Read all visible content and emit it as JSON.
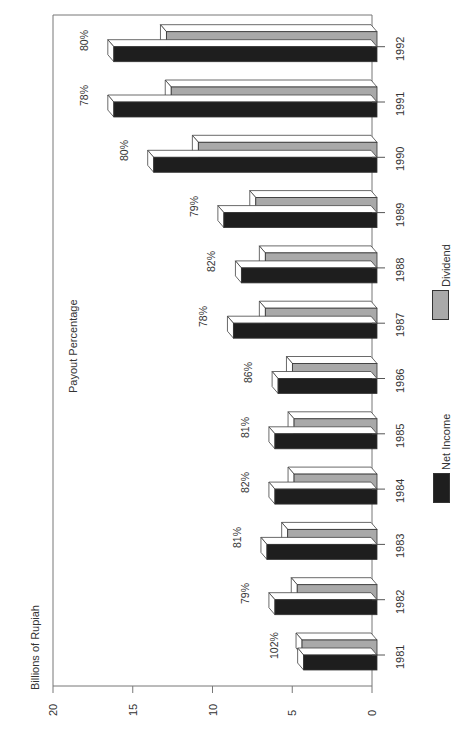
{
  "chart_data": {
    "type": "bar",
    "orientation": "rotated-90-ccw",
    "title": "",
    "ylabel": "Billions of Rupiah",
    "xlabel": "",
    "annotation_title": "Payout Percentage",
    "ylim": [
      0,
      20
    ],
    "yticks": [
      0,
      5,
      10,
      15,
      20
    ],
    "categories": [
      "1981",
      "1982",
      "1983",
      "1984",
      "1985",
      "1986",
      "1987",
      "1988",
      "1989",
      "1990",
      "1991",
      "1992"
    ],
    "series": [
      {
        "name": "Net Income",
        "color": "#1e1e1e",
        "values": [
          4.6,
          6.4,
          6.9,
          6.4,
          6.4,
          6.2,
          9.0,
          8.5,
          9.6,
          14.0,
          16.5,
          16.5
        ]
      },
      {
        "name": "Dividend",
        "color": "#a9a9a9",
        "values": [
          4.7,
          5.0,
          5.6,
          5.2,
          5.2,
          5.3,
          7.0,
          7.0,
          7.6,
          11.2,
          12.9,
          13.2
        ]
      }
    ],
    "payout_labels": [
      "102%",
      "79%",
      "81%",
      "82%",
      "81%",
      "86%",
      "78%",
      "82%",
      "79%",
      "80%",
      "78%",
      "80%"
    ],
    "legend": [
      {
        "label": "Net Income",
        "color": "#1e1e1e"
      },
      {
        "label": "Dividend",
        "color": "#a9a9a9"
      }
    ],
    "legend_position": "right",
    "grid": false,
    "style": "3d-bars"
  }
}
